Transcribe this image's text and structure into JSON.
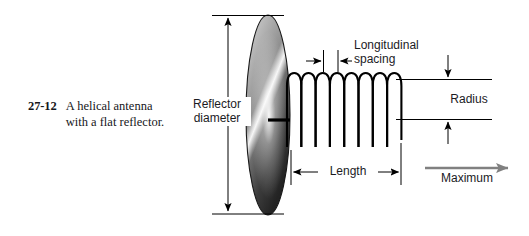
{
  "figure": {
    "number": "27-12",
    "caption_line1": "A helical antenna",
    "caption_line2": "with a flat reflector."
  },
  "labels": {
    "reflector_diameter_line1": "Reflector",
    "reflector_diameter_line2": "diameter",
    "longitudinal_spacing_line1": "Longitudinal",
    "longitudinal_spacing_line2": "spacing",
    "radius": "Radius",
    "length": "Length",
    "maximum": "Maximum"
  },
  "colors": {
    "ink": "#16161a",
    "line": "#000000",
    "radiation_arrow": "#808080",
    "background": "#ffffff",
    "reflector_light": "#f2f2f2",
    "reflector_mid": "#8a8a8a",
    "reflector_dark": "#2b2b2b"
  },
  "geometry": {
    "reflector_center_x": 268,
    "reflector_center_y": 115,
    "reflector_radius_x": 22,
    "reflector_radius_y": 100,
    "helix_turns": 8,
    "helix_start_x": 287,
    "helix_end_x": 401,
    "helix_top_y": 73,
    "helix_bottom_y": 147
  }
}
